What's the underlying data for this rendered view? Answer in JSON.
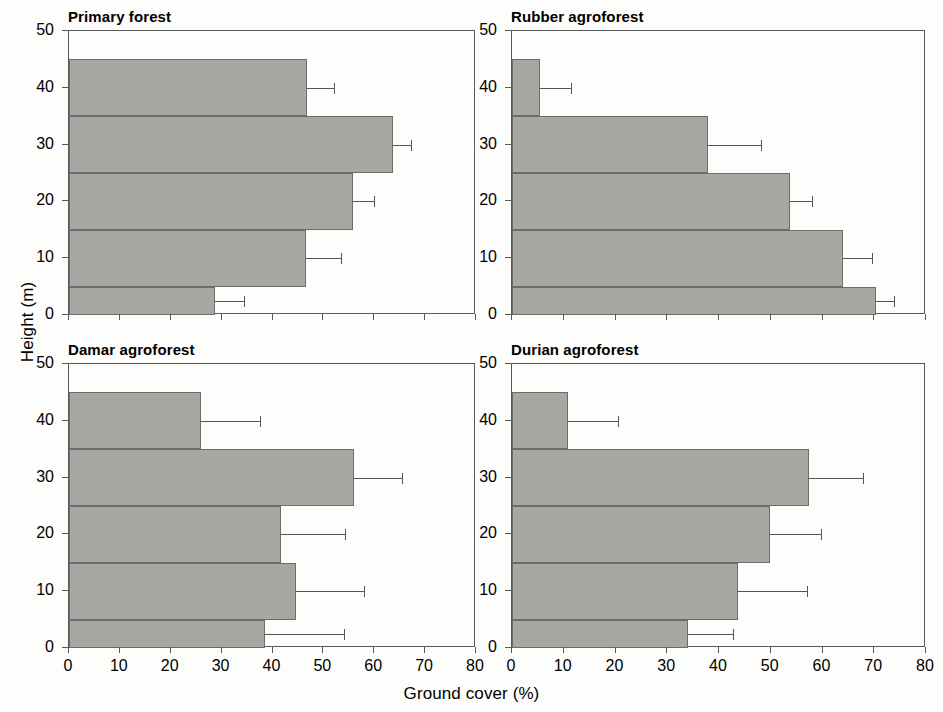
{
  "figure": {
    "xlabel": "Ground cover (%)",
    "ylabel": "Height (m)",
    "bar_color": "#a6a8a3",
    "axis_color": "#58595a",
    "error_color": "#54565a"
  },
  "axes": {
    "x": {
      "min": 0,
      "max": 80,
      "ticks": [
        0,
        10,
        20,
        30,
        40,
        50,
        60,
        70,
        80
      ],
      "tick_labels": [
        "0",
        "10",
        "20",
        "30",
        "40",
        "50",
        "60",
        "70",
        "80"
      ]
    },
    "y": {
      "min": 0,
      "max": 50,
      "ticks": [
        0,
        10,
        20,
        30,
        40,
        50
      ],
      "tick_labels": [
        "0",
        "10",
        "20",
        "30",
        "40",
        "50"
      ]
    }
  },
  "bands": [
    {
      "label": "0-5",
      "y0": 0,
      "y1": 5
    },
    {
      "label": "5-15",
      "y0": 5,
      "y1": 15
    },
    {
      "label": "15-25",
      "y0": 15,
      "y1": 25
    },
    {
      "label": "25-35",
      "y0": 25,
      "y1": 35
    },
    {
      "label": "35-45",
      "y0": 35,
      "y1": 45
    }
  ],
  "chart_data": {
    "type": "bar",
    "title": "",
    "xlabel": "Ground cover (%)",
    "ylabel": "Height (m)",
    "xlim": [
      0,
      80
    ],
    "ylim": [
      0,
      50
    ],
    "grid": false,
    "legend": null,
    "orientation": "horizontal",
    "categories": [
      "0-5",
      "5-15",
      "15-25",
      "25-35",
      "35-45"
    ],
    "error_type": "upper-only standard deviation whisker",
    "panels": [
      {
        "name": "Primary forest",
        "position": "top-left",
        "values": [
          28.7,
          46.5,
          55.8,
          63.7,
          46.8
        ],
        "errors": [
          5.7,
          7.0,
          4.2,
          3.6,
          5.3
        ],
        "upper": [
          34.4,
          53.5,
          60.0,
          67.3,
          52.1
        ]
      },
      {
        "name": "Rubber agroforest",
        "position": "top-right",
        "values": [
          70.4,
          64.0,
          53.8,
          37.9,
          5.4
        ],
        "errors": [
          3.5,
          5.5,
          4.2,
          10.3,
          6.0
        ],
        "upper": [
          73.9,
          69.5,
          58.0,
          48.2,
          11.4
        ]
      },
      {
        "name": "Damar agroforest",
        "position": "bottom-left",
        "values": [
          38.6,
          44.6,
          41.7,
          56.0,
          26.0
        ],
        "errors": [
          15.5,
          13.4,
          12.6,
          9.5,
          11.5
        ],
        "upper": [
          54.1,
          58.0,
          54.3,
          65.5,
          37.5
        ]
      },
      {
        "name": "Durian agroforest",
        "position": "bottom-right",
        "values": [
          34.0,
          43.6,
          49.8,
          57.4,
          10.8
        ],
        "errors": [
          8.8,
          13.4,
          9.9,
          10.4,
          9.7
        ],
        "upper": [
          42.8,
          57.0,
          59.7,
          67.8,
          20.5
        ]
      }
    ]
  }
}
